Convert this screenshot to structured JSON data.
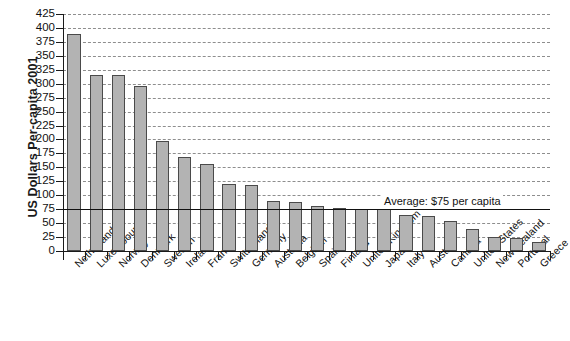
{
  "chart_data": {
    "type": "bar",
    "title": "",
    "xlabel": "",
    "ylabel": "US Dollars Per-capita 2001",
    "ylim": [
      0,
      425
    ],
    "ytick_step": 25,
    "yticks": [
      0,
      25,
      50,
      75,
      100,
      125,
      150,
      175,
      200,
      225,
      250,
      275,
      300,
      325,
      350,
      375,
      400,
      425
    ],
    "grid": true,
    "legend": "none",
    "bar_color": "#b3b3b3",
    "bar_edge_color": "#4a4a4a",
    "gridline_color": "#8e8e8e",
    "axis_color": "#1a1a1a",
    "categories": [
      "Netherlands",
      "Luxembourg",
      "Norway",
      "Denmark",
      "Sweden",
      "Ireland",
      "France",
      "Switzerland",
      "Germany",
      "Australia",
      "Belgium",
      "Spain",
      "Finland",
      "United Kingdom",
      "Japan",
      "Italy",
      "Austria",
      "Canada",
      "United States",
      "New Zealand",
      "Portugal",
      "Greece"
    ],
    "values": [
      390,
      315,
      315,
      296,
      197,
      168,
      156,
      121,
      119,
      90,
      88,
      80,
      77,
      76,
      75,
      64,
      62,
      54,
      39,
      26,
      24,
      17
    ],
    "annotations": [
      {
        "name": "average-line",
        "label": "Average: $75 per capita",
        "value": 75,
        "type": "horizontal-line"
      }
    ]
  }
}
